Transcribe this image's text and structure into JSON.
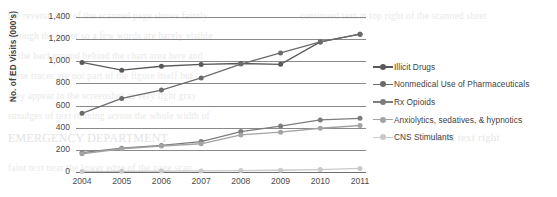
{
  "chart_data": {
    "type": "line",
    "title": "",
    "xlabel": "",
    "ylabel": "No. of ED Visits (000's)",
    "categories": [
      "2004",
      "2005",
      "2006",
      "2007",
      "2008",
      "2009",
      "2010",
      "2011"
    ],
    "x": [
      2004,
      2005,
      2006,
      2007,
      2008,
      2009,
      2010,
      2011
    ],
    "ylim": [
      0,
      1400
    ],
    "yticks": [
      0,
      200,
      400,
      600,
      800,
      1000,
      1200,
      1400
    ],
    "ytick_labels": [
      "0",
      "200",
      "400",
      "600",
      "800",
      "1,000",
      "1,200",
      "1,400"
    ],
    "grid": true,
    "legend_position": "right",
    "series": [
      {
        "name": "Illicit Drugs",
        "color": "#595959",
        "marker": "circle",
        "values": [
          990,
          920,
          955,
          972,
          980,
          973,
          1175,
          1245
        ]
      },
      {
        "name": "Nonmedical Use of Pharmaceuticals",
        "color": "#6b6b6b",
        "marker": "circle",
        "values": [
          530,
          665,
          740,
          850,
          975,
          1075,
          1175,
          1245
        ]
      },
      {
        "name": "Rx Opioids",
        "color": "#7d7d7d",
        "marker": "circle",
        "values": [
          175,
          215,
          240,
          275,
          365,
          415,
          470,
          485
        ]
      },
      {
        "name": "Anxiolytics, sedatives, & hypnotics",
        "color": "#a3a3a3",
        "marker": "circle",
        "values": [
          165,
          210,
          235,
          255,
          335,
          360,
          395,
          420
        ]
      },
      {
        "name": "CNS Stimulants",
        "color": "#c9c9c9",
        "marker": "circle",
        "values": [
          5,
          6,
          8,
          10,
          13,
          16,
          22,
          32
        ]
      }
    ]
  },
  "axis": {
    "y_title": "No. of ED Visits (000's)",
    "y_tick_labels": [
      "1,400",
      "1,200",
      "1,000",
      "800",
      "600",
      "400",
      "200",
      "0"
    ],
    "x_tick_labels": [
      "2004",
      "2005",
      "2006",
      "2007",
      "2008",
      "2009",
      "2010",
      "2011"
    ]
  },
  "legend": {
    "items": [
      {
        "label": "Illicit Drugs",
        "color": "#595959"
      },
      {
        "label": "Nonmedical Use of Pharmaceuticals",
        "color": "#6b6b6b"
      },
      {
        "label": "Rx Opioids",
        "color": "#7d7d7d"
      },
      {
        "label": "Anxiolytics, sedatives, & hypnotics",
        "color": "#a3a3a3"
      },
      {
        "label": "CNS Stimulants",
        "color": "#c9c9c9"
      }
    ]
  },
  "background_artifacts": {
    "lines": [
      "the reverse side of the scanned page shows faintly",
      "through the paper so a few words are barely visible",
      "in the background behind the chart area here and",
      "these traces are not part of the figure itself but",
      "they appear in the screenshot as very light gray",
      "smudges of text running across the whole width of",
      "EMERGENCY DEPARTMENT",
      "faint text near the lower edge of the page scan",
      "continued text at top right of the scanned sheet",
      "bleed text right"
    ]
  }
}
